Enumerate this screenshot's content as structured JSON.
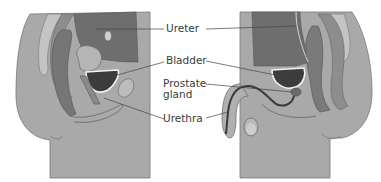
{
  "diagram": {
    "type": "anatomical-cross-section",
    "panels": [
      {
        "name": "female-pelvis",
        "side": "left"
      },
      {
        "name": "male-pelvis",
        "side": "right"
      }
    ],
    "labels": {
      "ureter": "Ureter",
      "bladder": "Bladder",
      "prostate_line1": "Prostate",
      "prostate_line2": "gland",
      "urethra": "Urethra"
    },
    "colors": {
      "background": "#ffffff",
      "body": "#a8a8a8",
      "body_light": "#bdbdbd",
      "organ_dark": "#6e6e6e",
      "organ_mid": "#8a8a8a",
      "bladder_fill": "#3c3c3c",
      "outline": "#555555",
      "highlight": "#f2f2f2",
      "leader_line": "#444444",
      "text": "#3a3a3a"
    }
  }
}
